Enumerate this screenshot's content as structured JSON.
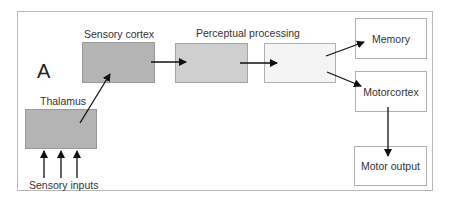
{
  "diagram": {
    "panel_label": "A",
    "nodes": {
      "thalamus": {
        "label": "Thalamus",
        "fill": "#b4b4b4"
      },
      "sensory_cortex": {
        "label": "Sensory cortex",
        "fill": "#b4b4b4"
      },
      "perceptual_processing": {
        "label": "Perceptual processing",
        "fill": "#cfcfcf"
      },
      "post_perceptual": {
        "label": "",
        "fill": "#f4f4f4"
      },
      "memory": {
        "label": "Memory",
        "fill": "#ffffff"
      },
      "motorcortex": {
        "label": "Motorcortex",
        "fill": "#ffffff"
      },
      "motor_output": {
        "label": "Motor output",
        "fill": "#ffffff"
      }
    },
    "inputs_label": "Sensory inputs",
    "edges": [
      {
        "from": "sensory_inputs",
        "to": "thalamus",
        "count": 3
      },
      {
        "from": "thalamus",
        "to": "sensory_cortex"
      },
      {
        "from": "sensory_cortex",
        "to": "perceptual_processing"
      },
      {
        "from": "perceptual_processing",
        "to": "post_perceptual"
      },
      {
        "from": "post_perceptual",
        "to": "memory"
      },
      {
        "from": "post_perceptual",
        "to": "motorcortex"
      },
      {
        "from": "motorcortex",
        "to": "motor_output"
      }
    ]
  }
}
